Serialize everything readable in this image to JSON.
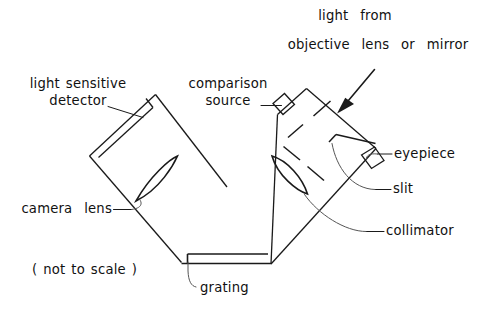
{
  "figure": {
    "type": "schematic-diagram",
    "note": "( not to scale )",
    "stroke_color": "#1a1a1a",
    "background_color": "#ffffff"
  },
  "labels": {
    "light_from": "light  from",
    "objective": "objective  lens  or  mirror",
    "detector_line1": "light sensitive",
    "detector_line2": "detector",
    "comparison_line1": "comparison",
    "comparison_line2": "source",
    "eyepiece": "eyepiece",
    "slit": "slit",
    "collimator": "collimator",
    "camera_lens": "camera  lens",
    "grating": "grating",
    "not_to_scale": "( not to scale )"
  },
  "components": [
    {
      "name": "light-sensitive-detector",
      "label": "light sensitive detector"
    },
    {
      "name": "camera-lens",
      "label": "camera lens"
    },
    {
      "name": "comparison-source",
      "label": "comparison source"
    },
    {
      "name": "eyepiece",
      "label": "eyepiece"
    },
    {
      "name": "slit",
      "label": "slit"
    },
    {
      "name": "collimator",
      "label": "collimator"
    },
    {
      "name": "grating",
      "label": "grating"
    },
    {
      "name": "incoming-light-arrow",
      "label": "light from objective lens or mirror"
    }
  ]
}
